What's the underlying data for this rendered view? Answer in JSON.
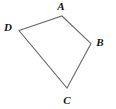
{
  "figure": {
    "type": "quadrilateral-diagram",
    "background_color": "#ffffff",
    "stroke_color": "#6b6b6b",
    "stroke_width": 1.1,
    "label_color": "#141414",
    "canvas": {
      "width": 116,
      "height": 109
    },
    "vertices": [
      {
        "name": "A",
        "label": "A",
        "x": 62,
        "y": 16,
        "label_x": 61,
        "label_y": 6
      },
      {
        "name": "B",
        "label": "B",
        "x": 91,
        "y": 43.5,
        "label_x": 100,
        "label_y": 42
      },
      {
        "name": "C",
        "label": "C",
        "x": 67,
        "y": 88,
        "label_x": 67,
        "label_y": 100
      },
      {
        "name": "D",
        "label": "D",
        "x": 19,
        "y": 30.5,
        "label_x": 8,
        "label_y": 27
      }
    ],
    "edges": [
      {
        "name": "edge-DA",
        "from": "D",
        "to": "A"
      },
      {
        "name": "edge-AB",
        "from": "A",
        "to": "B"
      },
      {
        "name": "edge-BC",
        "from": "B",
        "to": "C"
      },
      {
        "name": "edge-CD",
        "from": "C",
        "to": "D"
      }
    ],
    "polygon_points": "62,16 91,43.5 67,88 19,30.5"
  }
}
